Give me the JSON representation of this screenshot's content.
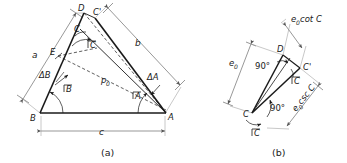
{
  "figure": {
    "stroke_color": "#1a1a1a",
    "dim_color": "#6b6b6b",
    "background": "#ffffff",
    "captions": {
      "a": "(a)",
      "b": "(b)"
    }
  },
  "panel_a": {
    "caption": "(a)",
    "vertices": {
      "A": "A",
      "B": "B",
      "C": "C",
      "C_prime": "C'",
      "D": "D",
      "E": "E"
    },
    "sides": {
      "a": "a",
      "b": "b",
      "c": "c"
    },
    "angles": {
      "angle_A": "A",
      "angle_B": "B",
      "angle_C": "C",
      "delta_A": "ΔA",
      "delta_B": "ΔB"
    },
    "segments": {
      "p0": "p",
      "p0_sub": "0"
    }
  },
  "panel_b": {
    "caption": "(b)",
    "vertices": {
      "C": "C",
      "C_prime": "C'",
      "D": "D"
    },
    "angles": {
      "right_angle_upper": "90°",
      "right_angle_lower": "90°",
      "angle_C_upper": "C",
      "angle_C_lower": "C"
    },
    "labels": {
      "e0": "e",
      "e0_sub": "0",
      "e0_cot_C": "cot C",
      "e0_csc_C": "csc C"
    }
  }
}
